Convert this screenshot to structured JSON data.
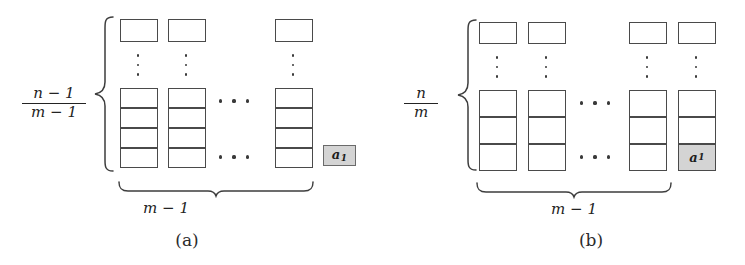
{
  "figure": {
    "background_color": "#ffffff",
    "stroke_color": "#4a4a4a",
    "shade_color": "#d4d4d4"
  },
  "panels": [
    {
      "id": "a",
      "caption": "(a)",
      "height_label": {
        "numerator": "n − 1",
        "denominator": "m − 1"
      },
      "width_label": "m − 1",
      "columns_shown": 3,
      "cells_per_lower_stack": 4,
      "highlight": {
        "label": "a",
        "subscript": "1",
        "placement": "detached-right-of-last-column"
      },
      "vertical_ellipsis_count": 3,
      "horizontal_ellipsis_count": 3,
      "horizontal_ellipsis_rows": 2
    },
    {
      "id": "b",
      "caption": "(b)",
      "height_label": {
        "numerator": "n",
        "denominator": "m"
      },
      "width_label": "m − 1",
      "columns_shown": 4,
      "cells_per_lower_stack": 3,
      "highlight": {
        "label": "a",
        "subscript": "1",
        "placement": "bottom-cell-of-last-column"
      },
      "vertical_ellipsis_count": 3,
      "horizontal_ellipsis_count": 3,
      "horizontal_ellipsis_rows": 2
    }
  ]
}
